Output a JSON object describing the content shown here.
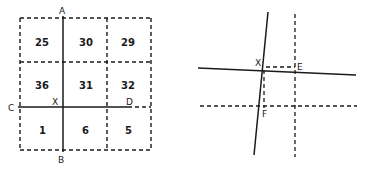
{
  "left_figure": {
    "cells": [
      {
        "row": 0,
        "col": 0,
        "value": "25"
      },
      {
        "row": 0,
        "col": 1,
        "value": "30"
      },
      {
        "row": 0,
        "col": 2,
        "value": "29"
      },
      {
        "row": 1,
        "col": 0,
        "value": "36"
      },
      {
        "row": 1,
        "col": 1,
        "value": "31"
      },
      {
        "row": 1,
        "col": 2,
        "value": "32"
      },
      {
        "row": 2,
        "col": 0,
        "value": "1"
      },
      {
        "row": 2,
        "col": 1,
        "value": "6"
      },
      {
        "row": 2,
        "col": 2,
        "value": "5"
      }
    ],
    "labels": {
      "A": "A",
      "B": "B",
      "C": "C",
      "D": "D",
      "X": "X"
    }
  },
  "right_figure": {
    "labels": {
      "X": "X",
      "E": "E",
      "F": "F"
    }
  },
  "colors": {
    "ink": "#1a1a1a",
    "background": "#ffffff"
  }
}
